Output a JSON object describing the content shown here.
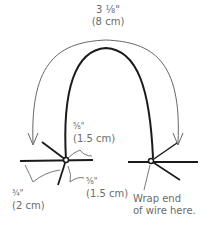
{
  "diagram": {
    "labels": {
      "top_length": {
        "imperial": "3 ⅛\"",
        "metric": "(8 cm)"
      },
      "left_upper_length": {
        "imperial": "⅝\"",
        "metric": "(1.5 cm)"
      },
      "left_lower_length": {
        "imperial": "⅝\"",
        "metric": "(1.5 cm)"
      },
      "left_side_length": {
        "imperial": "¾\"",
        "metric": "(2 cm)"
      },
      "wrap_note": {
        "line1": "Wrap end",
        "line2": "of wire here."
      }
    },
    "colors": {
      "line": "#1a1a1a",
      "guide": "#555555",
      "text": "#6b6b6b"
    }
  }
}
